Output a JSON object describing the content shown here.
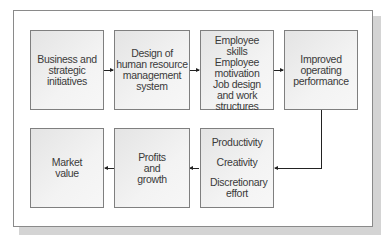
{
  "diagram": {
    "top_row": [
      {
        "id": "business",
        "lines": [
          "Business and",
          "strategic",
          "initiatives"
        ]
      },
      {
        "id": "hr-design",
        "lines": [
          "Design of",
          "human resource",
          "management",
          "system"
        ]
      },
      {
        "id": "employee",
        "items": [
          "Employee skills",
          "Employee motivation",
          "Job design and work structures"
        ]
      },
      {
        "id": "performance",
        "lines": [
          "Improved",
          "operating",
          "performance"
        ]
      }
    ],
    "bottom_row": [
      {
        "id": "market",
        "lines": [
          "Market",
          "value"
        ]
      },
      {
        "id": "profits",
        "lines": [
          "Profits",
          "and",
          "growth"
        ]
      },
      {
        "id": "outcomes",
        "items": [
          "Productivity",
          "Creativity",
          "Discretionary effort"
        ]
      }
    ],
    "flow": [
      "Business and strategic initiatives",
      "Design of human resource management system",
      "Employee skills / Employee motivation / Job design and work structures",
      "Improved operating performance",
      "Productivity / Creativity / Discretionary effort",
      "Profits and growth",
      "Market value"
    ]
  }
}
